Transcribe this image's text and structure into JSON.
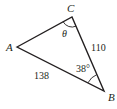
{
  "diagram": {
    "type": "triangle",
    "colors": {
      "stroke": "#231f20",
      "text": "#231f20",
      "background": "#ffffff"
    },
    "vertices": {
      "A": {
        "label": "A",
        "x": 17,
        "y": 47
      },
      "B": {
        "label": "B",
        "x": 104,
        "y": 91
      },
      "C": {
        "label": "C",
        "x": 72,
        "y": 17
      }
    },
    "sides": {
      "CB": {
        "label": "110"
      },
      "AB": {
        "label": "138"
      }
    },
    "angles": {
      "C": {
        "label": "θ"
      },
      "B": {
        "label": "38°"
      }
    }
  }
}
